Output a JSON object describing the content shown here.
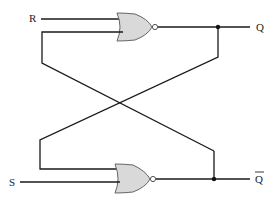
{
  "diagram": {
    "inputs": [
      {
        "id": "R",
        "label": "R"
      },
      {
        "id": "S",
        "label": "S"
      }
    ],
    "outputs": [
      {
        "id": "Q",
        "label": "Q"
      },
      {
        "id": "Qbar",
        "label": "Q",
        "overline": true
      }
    ],
    "gates": [
      {
        "id": "top-nor",
        "type": "NOR",
        "inputs": [
          "R",
          "Qbar"
        ],
        "output": "Q"
      },
      {
        "id": "bottom-nor",
        "type": "NOR",
        "inputs": [
          "Q",
          "S"
        ],
        "output": "Qbar"
      }
    ],
    "colors": {
      "wire": "#1a1a1a",
      "gate_fill": "#d9d9d9",
      "gate_stroke": "#666666"
    }
  }
}
